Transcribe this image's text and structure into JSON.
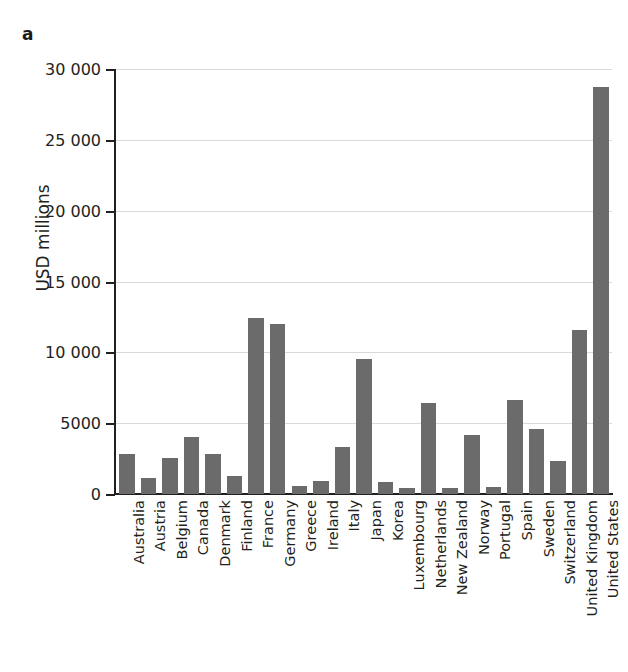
{
  "panel": {
    "label": "a"
  },
  "axes": {
    "y_title": "USD millions",
    "y_ticks": [
      "0",
      "5000",
      "10 000",
      "15 000",
      "20 000",
      "25 000",
      "30 000"
    ]
  },
  "colors": {
    "bar": "#6b6b6b",
    "axis": "#231f20",
    "gridline": "#d9d9d9",
    "background": "#ffffff"
  },
  "chart_data": {
    "type": "bar",
    "title": "",
    "subtitle": "",
    "xlabel": "",
    "ylabel": "USD millions",
    "ylim": [
      0,
      30000
    ],
    "ytick_values": [
      0,
      5000,
      10000,
      15000,
      20000,
      25000,
      30000
    ],
    "ytick_labels": [
      "0",
      "5000",
      "10 000",
      "15 000",
      "20 000",
      "25 000",
      "30 000"
    ],
    "grid": true,
    "legend": null,
    "categories": [
      "Australia",
      "Austria",
      "Belgium",
      "Canada",
      "Denmark",
      "Finland",
      "France",
      "Germany",
      "Greece",
      "Ireland",
      "Italy",
      "Japan",
      "Korea",
      "Luxembourg",
      "Netherlands",
      "New Zealand",
      "Norway",
      "Portugal",
      "Spain",
      "Sweden",
      "Switzerland",
      "United Kingdom",
      "United States"
    ],
    "values": [
      2800,
      1100,
      2550,
      4050,
      2800,
      1250,
      12400,
      12000,
      600,
      900,
      3300,
      9550,
      850,
      400,
      6450,
      400,
      4150,
      500,
      6650,
      4600,
      2300,
      11550,
      28750
    ]
  }
}
